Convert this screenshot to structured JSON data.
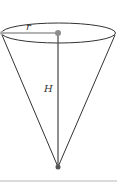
{
  "diagram": {
    "type": "cone",
    "labels": {
      "radius": "r",
      "height": "H"
    },
    "colors": {
      "outline": "#333333",
      "radius_line": "#9a9a9a",
      "dot": "#8c8c8c",
      "apex_dot": "#555555",
      "divider": "#cfcfcf"
    }
  }
}
